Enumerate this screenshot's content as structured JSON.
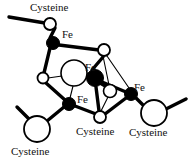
{
  "figure": {
    "background_color": "#ffffff",
    "stroke_color": "#000000",
    "fe_fill_color": "#000000",
    "sulfur_fill_color": "#ffffff"
  },
  "labels": {
    "cysteine_top_left": "Cysteine",
    "cysteine_bottom_left": "Cysteine",
    "cysteine_bottom_center": "Cysteine",
    "cysteine_bottom_right": "Cysteine",
    "fe_top": "Fe",
    "fe_center": "Fe",
    "fe_lower_left": "Fe",
    "fe_right": "Fe"
  },
  "atoms": {
    "iron": [
      {
        "name": "fe-top",
        "label": "Fe",
        "x": 53,
        "y": 43,
        "r": 6.5
      },
      {
        "name": "fe-center",
        "label": "Fe",
        "x": 95,
        "y": 78,
        "r": 8.5
      },
      {
        "name": "fe-lower-left",
        "label": "Fe",
        "x": 69,
        "y": 104,
        "r": 6.5
      },
      {
        "name": "fe-right",
        "label": "Fe",
        "x": 131,
        "y": 94,
        "r": 6.5
      }
    ],
    "sulfur_bridging": [
      {
        "name": "s-top-right",
        "x": 104,
        "y": 50,
        "r": 6
      },
      {
        "name": "s-center-large",
        "x": 74,
        "y": 73,
        "r": 13
      },
      {
        "name": "s-left",
        "x": 43,
        "y": 78,
        "r": 5.5
      },
      {
        "name": "s-bottom-center",
        "x": 100,
        "y": 117,
        "r": 6
      },
      {
        "name": "s-inner-small",
        "x": 110,
        "y": 91,
        "r": 6.5
      }
    ],
    "sulfur_cysteine": [
      {
        "name": "s-cys-top-left",
        "x": 50,
        "y": 24,
        "r": 6
      },
      {
        "name": "s-cys-bottom-left",
        "x": 37,
        "y": 129,
        "r": 13
      },
      {
        "name": "s-cys-bottom-right",
        "x": 154,
        "y": 113,
        "r": 13
      }
    ]
  },
  "bonds": {
    "thick": [
      {
        "name": "bond-cys-tl-chain",
        "x1": 9,
        "y1": 17,
        "x2": 44,
        "y2": 23
      },
      {
        "name": "bond-stl-fetop",
        "x1": 55,
        "y1": 27,
        "x2": 49,
        "y2": 39
      },
      {
        "name": "bond-fetop-str",
        "x1": 59,
        "y1": 45,
        "x2": 98,
        "y2": 50
      },
      {
        "name": "bond-fetop-sleft",
        "x1": 49,
        "y1": 48,
        "x2": 44,
        "y2": 73
      },
      {
        "name": "bond-sleft-felowerleft",
        "x1": 46,
        "y1": 83,
        "x2": 64,
        "y2": 100
      },
      {
        "name": "bond-felowerleft-sbottom",
        "x1": 75,
        "y1": 106,
        "x2": 95,
        "y2": 115
      },
      {
        "name": "bond-sbottom-feright",
        "x1": 105,
        "y1": 114,
        "x2": 126,
        "y2": 98
      },
      {
        "name": "bond-feright-scysbr",
        "x1": 137,
        "y1": 97,
        "x2": 143,
        "y2": 107
      },
      {
        "name": "bond-scysbr-chain",
        "x1": 165,
        "y1": 109,
        "x2": 186,
        "y2": 99
      },
      {
        "name": "bond-felowerleft-scysbl",
        "x1": 64,
        "y1": 107,
        "x2": 46,
        "y2": 122
      },
      {
        "name": "bond-scysbl-chain",
        "x1": 30,
        "y1": 121,
        "x2": 18,
        "y2": 108
      },
      {
        "name": "bond-fecenter-str",
        "x1": 92,
        "y1": 70,
        "x2": 103,
        "y2": 56
      },
      {
        "name": "bond-fecenter-sinner",
        "x1": 100,
        "y1": 84,
        "x2": 107,
        "y2": 87
      },
      {
        "name": "bond-fecenter-feright",
        "x1": 102,
        "y1": 82,
        "x2": 125,
        "y2": 92
      },
      {
        "name": "bond-fecenter-sbottom",
        "x1": 96,
        "y1": 87,
        "x2": 99,
        "y2": 111
      }
    ],
    "thin": [
      {
        "name": "bond-scenter-fecenter",
        "x1": 87,
        "y1": 75,
        "x2": 87,
        "y2": 78
      },
      {
        "name": "bond-sleft-scenter",
        "x1": 48,
        "y1": 78,
        "x2": 61,
        "y2": 76
      },
      {
        "name": "bond-scenter-felowerleft",
        "x1": 73,
        "y1": 86,
        "x2": 70,
        "y2": 98
      },
      {
        "name": "bond-str-feright",
        "x1": 107,
        "y1": 56,
        "x2": 129,
        "y2": 88
      },
      {
        "name": "bond-str-sinner",
        "x1": 103,
        "y1": 56,
        "x2": 109,
        "y2": 85
      },
      {
        "name": "bond-sinner-sbottom",
        "x1": 108,
        "y1": 96,
        "x2": 101,
        "y2": 111
      }
    ]
  },
  "label_positions": {
    "cysteine_top_left": {
      "x": 30,
      "y": 3
    },
    "fe_top": {
      "x": 62,
      "y": 30
    },
    "fe_center": {
      "x": 85,
      "y": 63
    },
    "fe_lower_left": {
      "x": 76,
      "y": 95
    },
    "fe_right": {
      "x": 134,
      "y": 83
    },
    "cysteine_bottom_center": {
      "x": 76,
      "y": 126
    },
    "cysteine_bottom_right": {
      "x": 129,
      "y": 127
    },
    "cysteine_bottom_left": {
      "x": 11,
      "y": 146
    }
  }
}
